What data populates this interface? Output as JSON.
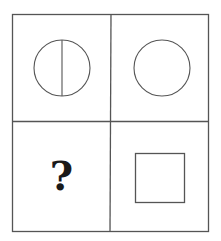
{
  "puzzle": {
    "grid": {
      "rows": 2,
      "cols": 2
    },
    "cells": [
      {
        "position": "top-left",
        "shape": "circle-with-vertical-line"
      },
      {
        "position": "top-right",
        "shape": "circle"
      },
      {
        "position": "bottom-left",
        "shape": "unknown",
        "label": "?"
      },
      {
        "position": "bottom-right",
        "shape": "square"
      }
    ],
    "colors": {
      "line": "#555555",
      "background": "#ffffff",
      "text": "#1a1a1a"
    }
  }
}
